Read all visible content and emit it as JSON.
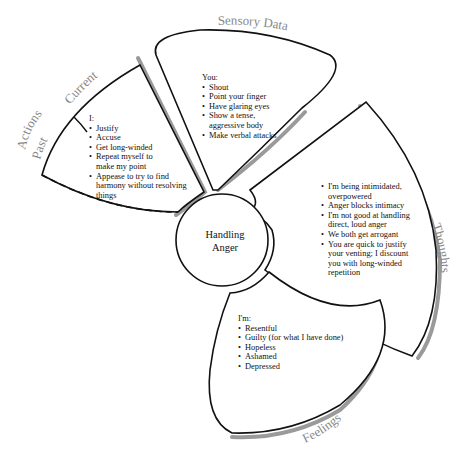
{
  "center": {
    "line1": "Handling",
    "line2": "Anger"
  },
  "petals": {
    "actions": {
      "labels": {
        "current": "Current",
        "actions": "Actions",
        "past": "Past"
      },
      "heading": "I:",
      "items": [
        "Justify",
        "Accuse",
        "Get long-winded",
        "Repeat myself to make my point",
        "Appease to try to find harmony without resolving things"
      ]
    },
    "sensory": {
      "label": "Sensory  Data",
      "heading": "You:",
      "items": [
        "Shout",
        "Point your finger",
        "Have glaring eyes",
        "Show a tense, aggressive body",
        "Make verbal attacks"
      ]
    },
    "thoughts": {
      "label": "Thoughts",
      "items": [
        "I'm being intimidated, overpowered",
        "Anger blocks intimacy",
        "I'm not good at handling direct, loud anger",
        "We both get arrogant",
        "You are quick to justify your venting; I discount you with long-winded repetition"
      ]
    },
    "feelings": {
      "label": "Feelings",
      "heading": "I'm:",
      "items": [
        "Resentful",
        "Guilty (for what I have done)",
        "Hopeless",
        "Ashamed",
        "Depressed"
      ]
    }
  },
  "colors": {
    "stroke": "#111111",
    "shadow": "#9a9a9a",
    "label": "#888888"
  }
}
